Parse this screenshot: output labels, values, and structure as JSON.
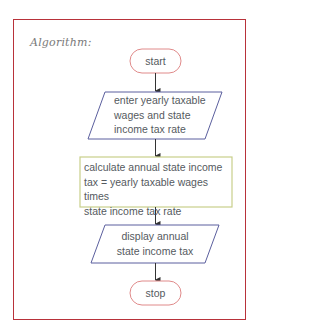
{
  "heading": "Algorithm:",
  "colors": {
    "frame": "#b8323a",
    "terminal": "#e08a8a",
    "io": "#5b5f9e",
    "process": "#c9cf8a",
    "arrow": "#333333",
    "text": "#555a60"
  },
  "flowchart": {
    "nodes": [
      {
        "id": "start",
        "type": "terminal",
        "label": "start"
      },
      {
        "id": "input",
        "type": "io",
        "lines": [
          "enter yearly taxable",
          "wages and state",
          "income tax rate"
        ]
      },
      {
        "id": "calc",
        "type": "process",
        "lines": [
          "calculate annual state income",
          "tax = yearly taxable wages times",
          "state income tax rate"
        ]
      },
      {
        "id": "output",
        "type": "io",
        "lines": [
          "display annual",
          "state income tax"
        ]
      },
      {
        "id": "stop",
        "type": "terminal",
        "label": "stop"
      }
    ],
    "edges": [
      [
        "start",
        "input"
      ],
      [
        "input",
        "calc"
      ],
      [
        "calc",
        "output"
      ],
      [
        "output",
        "stop"
      ]
    ]
  }
}
